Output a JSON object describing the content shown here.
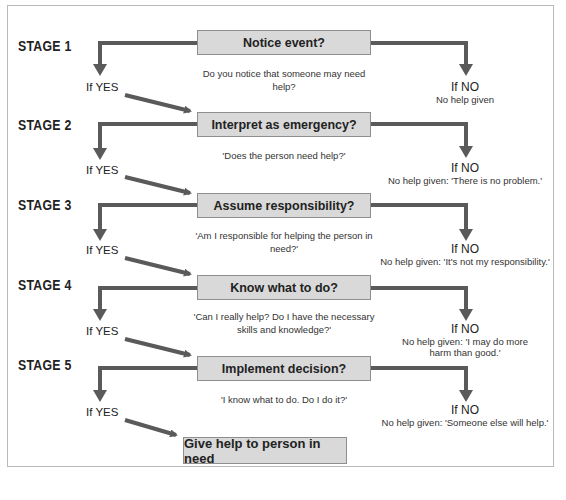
{
  "diagram": {
    "type": "flowchart",
    "colors": {
      "box_fill": "#d9d9d9",
      "box_border": "#8e8e8e",
      "arrow": "#5a5a5a",
      "frame_border": "#b9b9b9"
    },
    "stages": [
      {
        "label": "STAGE 1",
        "decision": "Notice event?",
        "question": "Do you notice that someone may need help?",
        "yes_label": "If YES",
        "no_label": "If NO",
        "no_outcome": "No help given"
      },
      {
        "label": "STAGE 2",
        "decision": "Interpret as emergency?",
        "question": "'Does the person need help?'",
        "yes_label": "If YES",
        "no_label": "If NO",
        "no_outcome": "No help given: 'There is no problem.'"
      },
      {
        "label": "STAGE 3",
        "decision": "Assume responsibility?",
        "question": "'Am I responsible for helping the person in need?'",
        "yes_label": "If YES",
        "no_label": "If NO",
        "no_outcome": "No help given: 'It's not my responsibility.'"
      },
      {
        "label": "STAGE 4",
        "decision": "Know what to do?",
        "question": "'Can I really help? Do I have the necessary skills and knowledge?'",
        "yes_label": "If YES",
        "no_label": "If NO",
        "no_outcome": "No help given: 'I may do more harm than good.'"
      },
      {
        "label": "STAGE 5",
        "decision": "Implement decision?",
        "question": "'I know what to do. Do I do it?'",
        "yes_label": "If YES",
        "no_label": "If NO",
        "no_outcome": "No help given: 'Someone else will help.'"
      }
    ],
    "final_outcome": "Give help to person in need"
  }
}
